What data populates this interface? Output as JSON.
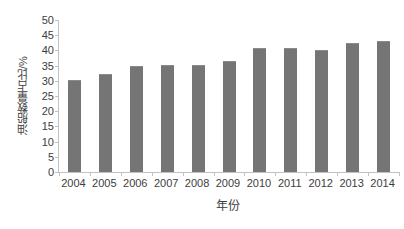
{
  "chart_data": {
    "type": "bar",
    "title": "",
    "xlabel": "年份",
    "ylabel": "油船数量占比/%",
    "categories": [
      "2004",
      "2005",
      "2006",
      "2007",
      "2008",
      "2009",
      "2010",
      "2011",
      "2012",
      "2013",
      "2014"
    ],
    "values": [
      30.3,
      32.4,
      35.0,
      35.2,
      35.3,
      36.6,
      40.9,
      40.8,
      40.2,
      42.5,
      43.2
    ],
    "ylim": [
      0,
      50
    ],
    "ytick_step": 5,
    "yticks": [
      "50",
      "45",
      "40",
      "35",
      "30",
      "25",
      "20",
      "15",
      "10",
      "5",
      "0"
    ],
    "ytick_values": [
      50,
      45,
      40,
      35,
      30,
      25,
      20,
      15,
      10,
      5,
      0
    ],
    "grid": false,
    "legend": "none",
    "bar_color": "#757575",
    "axis_color": "#c2c2c2",
    "text_color": "#3d3d3d",
    "background_color": "#ffffff"
  }
}
